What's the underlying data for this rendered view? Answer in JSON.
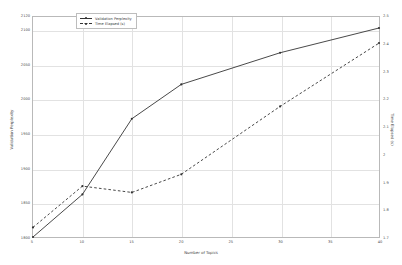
{
  "chart_data": {
    "type": "line",
    "title": "",
    "xlabel": "Number of Topics",
    "ylabel": "Validation Perplexity",
    "y2label": "Time Elapsed (s)",
    "x": [
      5,
      10,
      15,
      20,
      30,
      40
    ],
    "xlim": [
      5,
      40
    ],
    "ylim": [
      1800,
      2120
    ],
    "y2lim": [
      1.7,
      2.5
    ],
    "xticks": [
      5,
      10,
      15,
      20,
      25,
      30,
      35,
      40
    ],
    "xticklabels": [
      "5",
      "10",
      "15",
      "20",
      "25",
      "30",
      "35",
      "40"
    ],
    "yticks": [
      1800,
      1850,
      1900,
      1950,
      2000,
      2050,
      2100,
      2120
    ],
    "yticklabels": [
      "1800",
      "1850",
      "1900",
      "1950",
      "2000",
      "2050",
      "2100",
      "2120"
    ],
    "y2ticks": [
      1.7,
      1.8,
      1.9,
      2.0,
      2.1,
      2.2,
      2.3,
      2.4,
      2.5
    ],
    "y2ticklabels": [
      "1.7",
      "1.8",
      "1.9",
      "2",
      "2.1",
      "2.2",
      "2.3",
      "2.4",
      "2.5"
    ],
    "grid": true,
    "legend_position": "top-center",
    "series": [
      {
        "name": "Validation Perplexity",
        "axis": "left",
        "style": "solid",
        "color": "#333333",
        "marker": "dot",
        "values": [
          1800,
          1862,
          1972,
          2022,
          2068,
          2104
        ]
      },
      {
        "name": "Time Elapsed (s)",
        "axis": "right",
        "style": "dashed",
        "color": "#333333",
        "marker": "dot",
        "values": [
          1.735,
          1.885,
          1.862,
          1.928,
          2.175,
          2.405
        ]
      }
    ]
  },
  "legend": {
    "items": [
      {
        "label": "Validation Perplexity",
        "style": "solid"
      },
      {
        "label": "Time Elapsed (s)",
        "style": "dashed"
      }
    ]
  }
}
